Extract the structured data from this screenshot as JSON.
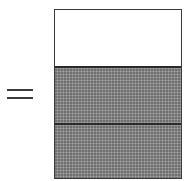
{
  "diagram": {
    "type": "fraction-bar",
    "equals_symbol": "=",
    "bar": {
      "total_parts": 3,
      "shaded_parts": 2,
      "parts": [
        {
          "index": 0,
          "state": "unshaded"
        },
        {
          "index": 1,
          "state": "shaded"
        },
        {
          "index": 2,
          "state": "shaded"
        }
      ]
    },
    "colors": {
      "outline": "#3a3a3a",
      "shaded_fill": "#8a8a8a",
      "unshaded_fill": "#ffffff"
    }
  }
}
